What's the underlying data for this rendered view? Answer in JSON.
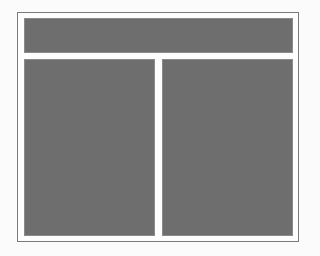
{
  "diagram": {
    "type": "layout-wireframe",
    "colors": {
      "frame": "#7a7a7a",
      "block_fill": "#6e6e6e",
      "background": "#fbfbfb"
    },
    "blocks": [
      {
        "id": "header"
      },
      {
        "id": "left-column"
      },
      {
        "id": "right-column"
      }
    ]
  }
}
